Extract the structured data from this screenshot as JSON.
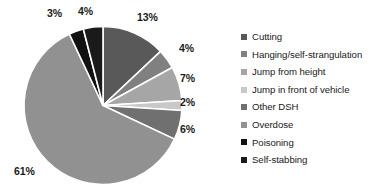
{
  "chart_data": {
    "type": "pie",
    "title": "",
    "categories": [
      "Cutting",
      "Hanging/self-strangulation",
      "Jump from height",
      "Jump in front of vehicle",
      "Other DSH",
      "Overdose",
      "Poisoning",
      "Self-stabbing"
    ],
    "values": [
      13,
      4,
      7,
      2,
      6,
      61,
      3,
      4
    ],
    "value_labels": [
      "13%",
      "4%",
      "7%",
      "2%",
      "6%",
      "61%",
      "3%",
      "4%"
    ],
    "colors": [
      "#595959",
      "#808080",
      "#a6a6a6",
      "#c8c8c8",
      "#707070",
      "#919191",
      "#111111",
      "#1a1a1a"
    ],
    "legend_position": "right",
    "start_angle_deg": 0,
    "direction": "clockwise",
    "slice_border_color": "#ffffff",
    "background": "#ffffff"
  },
  "legend": {
    "items": [
      {
        "label": "Cutting",
        "color": "#595959"
      },
      {
        "label": "Hanging/self-strangulation",
        "color": "#808080"
      },
      {
        "label": "Jump from height",
        "color": "#a6a6a6"
      },
      {
        "label": "Jump in front of vehicle",
        "color": "#c8c8c8"
      },
      {
        "label": "Other DSH",
        "color": "#707070"
      },
      {
        "label": "Overdose",
        "color": "#919191"
      },
      {
        "label": "Poisoning",
        "color": "#111111"
      },
      {
        "label": "Self-stabbing",
        "color": "#1a1a1a"
      }
    ]
  },
  "pie_labels": [
    {
      "text": "13%",
      "left": 137,
      "top": 12
    },
    {
      "text": "4%",
      "left": 179,
      "top": 43
    },
    {
      "text": "7%",
      "left": 180,
      "top": 73
    },
    {
      "text": "2%",
      "left": 180,
      "top": 97
    },
    {
      "text": "6%",
      "left": 180,
      "top": 124
    },
    {
      "text": "61%",
      "left": 14,
      "top": 166
    },
    {
      "text": "3%",
      "left": 47,
      "top": 8
    },
    {
      "text": "4%",
      "left": 78,
      "top": 6
    }
  ]
}
